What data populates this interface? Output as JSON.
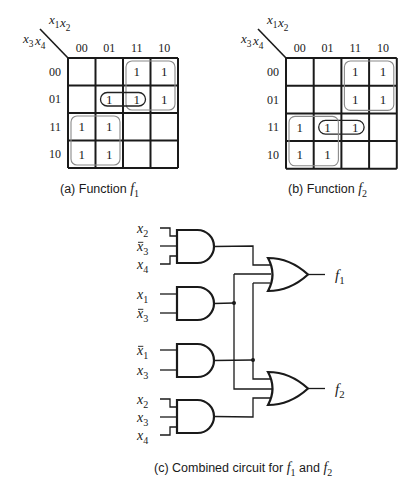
{
  "kmaps": [
    {
      "id": "a",
      "caption_prefix": "(a) Function ",
      "caption_var": "f",
      "caption_sub": "1",
      "row_var_label": {
        "base1": "x",
        "sub1": "3",
        "base2": "x",
        "sub2": "4"
      },
      "col_var_label": {
        "base1": "x",
        "sub1": "1",
        "base2": "x",
        "sub2": "2"
      },
      "col_headers": [
        "00",
        "01",
        "11",
        "10"
      ],
      "row_headers": [
        "00",
        "01",
        "11",
        "10"
      ],
      "cells": [
        [
          "",
          "",
          "1",
          "1"
        ],
        [
          "",
          "1",
          "1",
          "1"
        ],
        [
          "1",
          "1",
          "",
          ""
        ],
        [
          "1",
          "1",
          "",
          ""
        ]
      ],
      "groups": [
        {
          "rows": [
            0,
            1
          ],
          "cols": [
            2,
            3
          ],
          "style": "gray"
        },
        {
          "rows": [
            1,
            1
          ],
          "cols": [
            1,
            2
          ],
          "style": "dark"
        },
        {
          "rows": [
            2,
            3
          ],
          "cols": [
            0,
            1
          ],
          "style": "gray"
        }
      ]
    },
    {
      "id": "b",
      "caption_prefix": "(b) Function ",
      "caption_var": "f",
      "caption_sub": "2",
      "row_var_label": {
        "base1": "x",
        "sub1": "3",
        "base2": "x",
        "sub2": "4"
      },
      "col_var_label": {
        "base1": "x",
        "sub1": "1",
        "base2": "x",
        "sub2": "2"
      },
      "col_headers": [
        "00",
        "01",
        "11",
        "10"
      ],
      "row_headers": [
        "00",
        "01",
        "11",
        "10"
      ],
      "cells": [
        [
          "",
          "",
          "1",
          "1"
        ],
        [
          "",
          "",
          "1",
          "1"
        ],
        [
          "1",
          "1",
          "1",
          ""
        ],
        [
          "1",
          "1",
          "",
          ""
        ]
      ],
      "groups": [
        {
          "rows": [
            0,
            1
          ],
          "cols": [
            2,
            3
          ],
          "style": "gray"
        },
        {
          "rows": [
            2,
            2
          ],
          "cols": [
            1,
            2
          ],
          "style": "dark"
        },
        {
          "rows": [
            2,
            3
          ],
          "cols": [
            0,
            1
          ],
          "style": "gray"
        }
      ]
    }
  ],
  "circuit": {
    "caption_prefix": "(c) Combined circuit for ",
    "caption_f1_var": "f",
    "caption_f1_sub": "1",
    "caption_and": " and ",
    "caption_f2_var": "f",
    "caption_f2_sub": "2",
    "and_gates": [
      {
        "id": "and1",
        "inputs": [
          {
            "var": "x",
            "sub": "2",
            "bar": false
          },
          {
            "var": "x",
            "sub": "3",
            "bar": true
          },
          {
            "var": "x",
            "sub": "4",
            "bar": false
          }
        ]
      },
      {
        "id": "and2",
        "inputs": [
          {
            "var": "x",
            "sub": "1",
            "bar": false
          },
          {
            "var": "x",
            "sub": "3",
            "bar": true
          }
        ]
      },
      {
        "id": "and3",
        "inputs": [
          {
            "var": "x",
            "sub": "1",
            "bar": true
          },
          {
            "var": "x",
            "sub": "3",
            "bar": false
          }
        ]
      },
      {
        "id": "and4",
        "inputs": [
          {
            "var": "x",
            "sub": "2",
            "bar": false
          },
          {
            "var": "x",
            "sub": "3",
            "bar": false
          },
          {
            "var": "x",
            "sub": "4",
            "bar": false
          }
        ]
      }
    ],
    "or_gates": [
      {
        "id": "or1",
        "inputs": [
          "and1",
          "and2",
          "and3"
        ],
        "output": {
          "var": "f",
          "sub": "1"
        }
      },
      {
        "id": "or2",
        "inputs": [
          "and3",
          "and2",
          "and4"
        ],
        "output": {
          "var": "f",
          "sub": "2"
        }
      }
    ]
  },
  "colors": {
    "line": "#1a1a1a",
    "group_gray": "#8a8a8a",
    "group_dark": "#222222"
  }
}
